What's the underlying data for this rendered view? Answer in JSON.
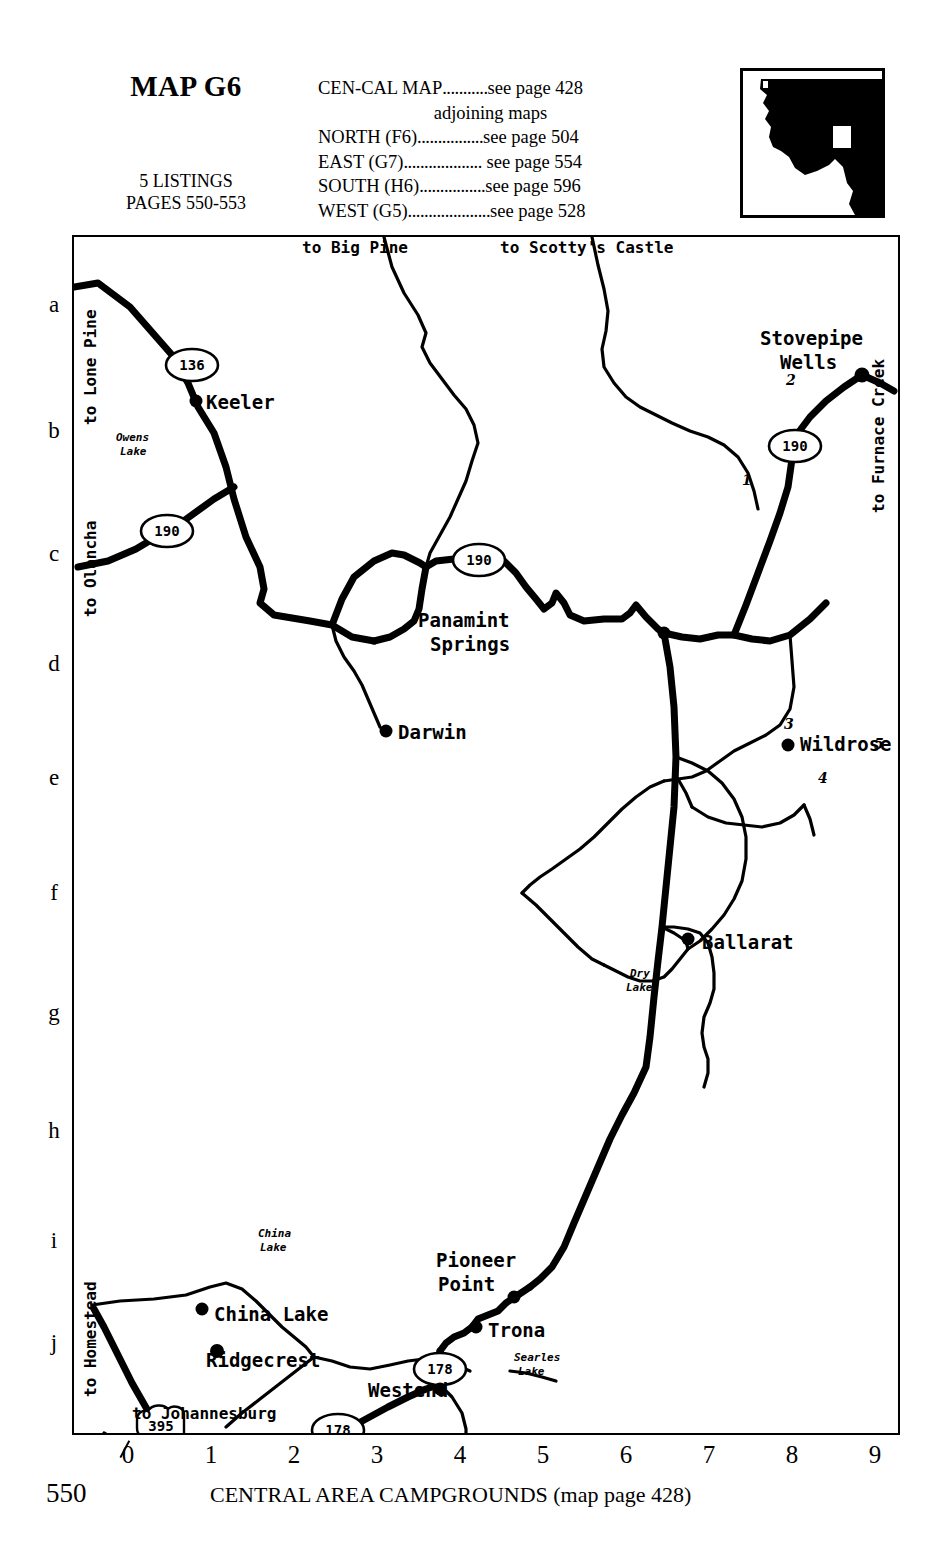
{
  "header": {
    "map_title": "MAP G6",
    "listings_line1": "5 LISTINGS",
    "listings_line2": "PAGES 550-553",
    "cencal_label": "CEN-CAL MAP",
    "cencal_dots": "...........",
    "cencal_page": "see page 428",
    "adjoining_caption": "adjoining maps",
    "adjoining": [
      {
        "label": "NORTH (F6)",
        "dots": "................",
        "page": "see page 504"
      },
      {
        "label": "EAST (G7)",
        "dots": "...................",
        "page": " see page 554"
      },
      {
        "label": "SOUTH (H6)",
        "dots": "................",
        "page": "see page 596"
      },
      {
        "label": "WEST (G5)",
        "dots": "....................",
        "page": "see page 528"
      }
    ]
  },
  "inset": {
    "name": "california-locator-inset",
    "description": "black silhouette of central-southern California with white rectangle locator"
  },
  "map": {
    "row_letters": [
      "a",
      "b",
      "c",
      "d",
      "e",
      "f",
      "g",
      "h",
      "i",
      "j"
    ],
    "col_numbers": [
      "0",
      "1",
      "2",
      "3",
      "4",
      "5",
      "6",
      "7",
      "8",
      "9"
    ],
    "edge_labels": [
      {
        "text": "to Lone Pine",
        "orientation": "vertical"
      },
      {
        "text": "to Olancha",
        "orientation": "vertical"
      },
      {
        "text": "to Homestead",
        "orientation": "vertical"
      },
      {
        "text": "to Big Pine",
        "orientation": "horizontal"
      },
      {
        "text": "to Scotty's Castle",
        "orientation": "horizontal"
      },
      {
        "text": "to Furnace Creek",
        "orientation": "vertical"
      },
      {
        "text": "to Johannesburg",
        "orientation": "horizontal"
      }
    ],
    "places": [
      {
        "name": "Keeler"
      },
      {
        "name": "Darwin"
      },
      {
        "name": "Panamint Springs",
        "line1": "Panamint",
        "line2": "Springs"
      },
      {
        "name": "Stovepipe Wells",
        "line1": "Stovepipe",
        "line2": "Wells"
      },
      {
        "name": "Wildrose"
      },
      {
        "name": "Ballarat"
      },
      {
        "name": "Pioneer Point",
        "line1": "Pioneer",
        "line2": "Point"
      },
      {
        "name": "Trona"
      },
      {
        "name": "Westend"
      },
      {
        "name": "China Lake"
      },
      {
        "name": "Ridgecrest"
      }
    ],
    "water_labels": [
      {
        "line1": "Owens",
        "line2": "Lake"
      },
      {
        "line1": "Dry",
        "line2": "Lake"
      },
      {
        "line1": "China",
        "line2": "Lake"
      },
      {
        "line1": "Searles",
        "line2": "Lake"
      }
    ],
    "route_shields": [
      {
        "number": "136",
        "shape": "oval"
      },
      {
        "number": "190",
        "shape": "oval"
      },
      {
        "number": "190",
        "shape": "oval"
      },
      {
        "number": "190",
        "shape": "oval"
      },
      {
        "number": "178",
        "shape": "oval"
      },
      {
        "number": "178",
        "shape": "oval"
      },
      {
        "number": "395",
        "shape": "us-shield"
      }
    ],
    "listing_numbers": [
      "1",
      "2",
      "3",
      "4",
      "5"
    ]
  },
  "footer": {
    "page_number": "550",
    "title": "CENTRAL AREA CAMPGROUNDS (map page 428)"
  }
}
